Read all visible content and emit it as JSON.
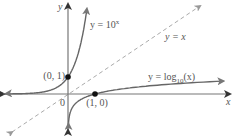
{
  "chart_data": {
    "type": "line",
    "title": "",
    "xlabel": "x",
    "ylabel": "y",
    "xlim": [
      -2.5,
      5.9
    ],
    "ylim": [
      -2.5,
      5.5
    ],
    "grid": false,
    "series": [
      {
        "name": "y = 10^x",
        "label_main": "y = 10",
        "label_sup": "x",
        "style": "solid",
        "color": "#666666",
        "x": [
          -2.5,
          -2,
          -1.5,
          -1,
          -0.5,
          0,
          0.25,
          0.5,
          0.6,
          0.7,
          0.74
        ],
        "y": [
          0.003,
          0.01,
          0.032,
          0.1,
          0.316,
          1,
          1.778,
          3.162,
          3.981,
          5.012,
          5.5
        ]
      },
      {
        "name": "y = log10(x)",
        "label_main": "y = log",
        "label_sub": "10",
        "label_tail": "(x)",
        "style": "solid",
        "color": "#666666",
        "x": [
          0.003,
          0.01,
          0.032,
          0.1,
          0.316,
          1,
          1.778,
          3.162,
          3.981,
          5.012,
          5.5
        ],
        "y": [
          -2.5,
          -2,
          -1.5,
          -1,
          -0.5,
          0,
          0.25,
          0.5,
          0.6,
          0.7,
          0.74
        ]
      },
      {
        "name": "y = x",
        "label": "y = x",
        "style": "dashed",
        "color": "#999999",
        "x": [
          -2.0,
          4.9
        ],
        "y": [
          -2.0,
          4.9
        ]
      }
    ],
    "points": [
      {
        "label": "(0, 1)",
        "x": 0,
        "y": 1
      },
      {
        "label": "(1, 0)",
        "x": 1,
        "y": 0
      }
    ],
    "origin_label": "0"
  }
}
